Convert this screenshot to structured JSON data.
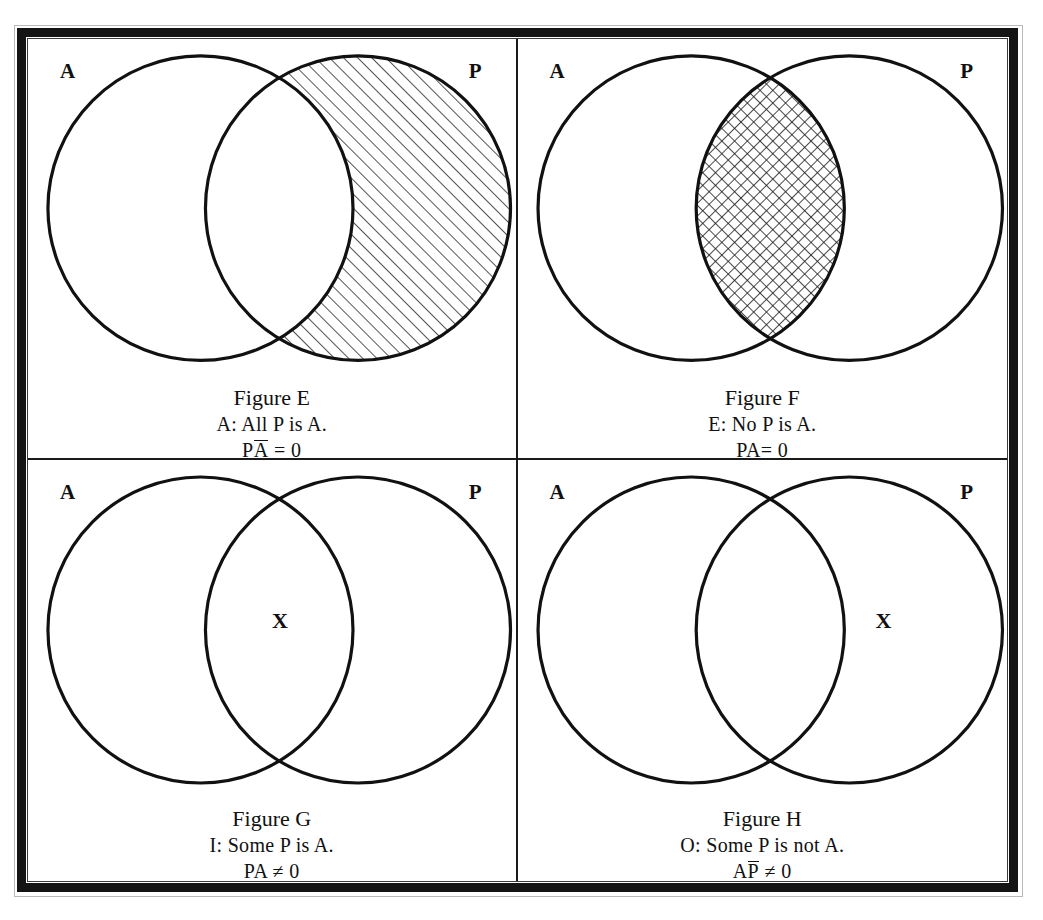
{
  "document": {
    "kind": "scanned-figure-plate",
    "description": "Four Venn diagrams of the traditional square of opposition (A, E, I, O propositions)",
    "background_color": "#ffffff",
    "ink_color": "#111111",
    "frame_color": "#141414"
  },
  "panels": [
    {
      "id": "figure-e",
      "position": "top-left",
      "left_set_label": "A",
      "right_set_label": "P",
      "shading": "diagonal-hatch",
      "shaded_region": "P-minus-A",
      "x_mark": null,
      "caption": {
        "title": "Figure E",
        "proposition": "A: All P is A.",
        "formula_prefix": "P",
        "formula_overlined": "A",
        "formula_suffix": " = 0",
        "formula_plain": "PA̅ = 0"
      }
    },
    {
      "id": "figure-f",
      "position": "top-right",
      "left_set_label": "A",
      "right_set_label": "P",
      "shading": "cross-hatch",
      "shaded_region": "intersection",
      "x_mark": null,
      "caption": {
        "title": "Figure F",
        "proposition": "E: No P is A.",
        "formula_prefix": "PA",
        "formula_overlined": "",
        "formula_suffix": "= 0",
        "formula_plain": "PA= 0"
      }
    },
    {
      "id": "figure-g",
      "position": "bottom-left",
      "left_set_label": "A",
      "right_set_label": "P",
      "shading": "none",
      "shaded_region": null,
      "x_mark": "X",
      "x_mark_region": "intersection",
      "caption": {
        "title": "Figure G",
        "proposition": "I: Some P is A.",
        "formula_prefix": "PA ",
        "formula_overlined": "",
        "formula_suffix": "≠ 0",
        "formula_plain": "PA ≠ 0"
      }
    },
    {
      "id": "figure-h",
      "position": "bottom-right",
      "left_set_label": "A",
      "right_set_label": "P",
      "shading": "none",
      "shaded_region": null,
      "x_mark": "X",
      "x_mark_region": "P-minus-A",
      "caption": {
        "title": "Figure H",
        "proposition": "O: Some P is not A.",
        "formula_prefix": "A",
        "formula_overlined": "P",
        "formula_suffix": " ≠ 0",
        "formula_plain": "AP̅ ≠ 0"
      }
    }
  ]
}
